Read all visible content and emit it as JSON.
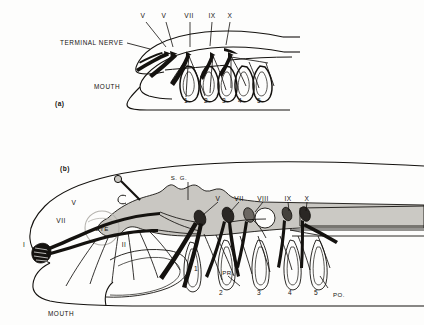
{
  "figure": {
    "background_color": "#fdfdfc",
    "ink_color": "#14120f",
    "brain_fill": "#c9c7c2",
    "cord_fill": "#cbc9c4",
    "panels": [
      {
        "id": "a",
        "panel_label": "(a)",
        "nerve_labels": [
          "V",
          "V",
          "VII",
          "IX",
          "X"
        ],
        "annotations": [
          "TERMINAL NERVE",
          "MOUTH"
        ],
        "gill_numbers": [
          "1",
          "2",
          "3",
          "4",
          "5"
        ]
      },
      {
        "id": "b",
        "panel_label": "(b)",
        "nerve_labels_dorsal": [
          "V",
          "VII",
          "VIII",
          "IX",
          "X"
        ],
        "nerve_labels_anterior": [
          "V",
          "VII",
          "I",
          "II"
        ],
        "annotations": [
          "S. G.",
          "EYE",
          "MOUTH",
          "PR.",
          "PO."
        ],
        "gill_numbers": [
          "1",
          "2",
          "3",
          "4",
          "5"
        ]
      }
    ]
  },
  "panel_a": {
    "label": "(a)",
    "terminal_nerve": "TERMINAL NERVE",
    "mouth": "MOUTH",
    "nerves": [
      {
        "name": "V",
        "x": 143,
        "y": 16
      },
      {
        "name": "V",
        "x": 163,
        "y": 16
      },
      {
        "name": "VII",
        "x": 188,
        "y": 16
      },
      {
        "name": "IX",
        "x": 211,
        "y": 16
      },
      {
        "name": "X",
        "x": 230,
        "y": 16
      }
    ],
    "gills": [
      {
        "n": "1",
        "x": 186,
        "y": 101
      },
      {
        "n": "2",
        "x": 206,
        "y": 101
      },
      {
        "n": "3",
        "x": 224,
        "y": 101
      },
      {
        "n": "4",
        "x": 240,
        "y": 101
      },
      {
        "n": "5",
        "x": 259,
        "y": 101
      }
    ]
  },
  "panel_b": {
    "label": "(b)",
    "mouth": "MOUTH",
    "eye": "EYE",
    "spinal_ganglion": "S. G.",
    "pre_branchial": "PR.",
    "post_branchial": "PO.",
    "nerves_dorsal": [
      {
        "name": "V",
        "x": 216,
        "y": 198
      },
      {
        "name": "VII",
        "x": 237,
        "y": 198
      },
      {
        "name": "VIII",
        "x": 261,
        "y": 198
      },
      {
        "name": "IX",
        "x": 288,
        "y": 198
      },
      {
        "name": "X",
        "x": 306,
        "y": 198
      }
    ],
    "nerves_anterior": [
      {
        "name": "V",
        "x": 74,
        "y": 202
      },
      {
        "name": "VII",
        "x": 61,
        "y": 221
      },
      {
        "name": "I",
        "x": 24,
        "y": 244
      },
      {
        "name": "II",
        "x": 122,
        "y": 244
      }
    ],
    "gills": [
      {
        "n": "1",
        "x": 196,
        "y": 268
      },
      {
        "n": "2",
        "x": 221,
        "y": 293
      },
      {
        "n": "3",
        "x": 259,
        "y": 292
      },
      {
        "n": "4",
        "x": 290,
        "y": 292
      },
      {
        "n": "5",
        "x": 316,
        "y": 292
      }
    ]
  }
}
